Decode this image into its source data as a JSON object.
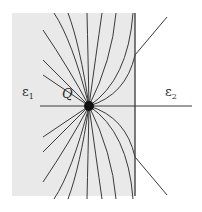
{
  "figure": {
    "labels": {
      "charge": "Q",
      "region_left_symbol": "ε",
      "region_left_sub": "1",
      "region_right_symbol": "ε",
      "region_right_sub": "2"
    },
    "colors": {
      "region_left_fill": "#e9e9e9",
      "line": "#3a3a3a",
      "charge": "#111111",
      "interface": "#444444"
    },
    "field_lines": {
      "upper_count": 10,
      "lower_count": 10,
      "transmitted_count": 2
    }
  }
}
